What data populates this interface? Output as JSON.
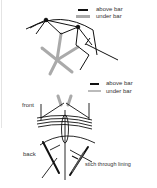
{
  "figure": {
    "legend_top": {
      "above_label": "above bar",
      "under_label": "under bar"
    },
    "legend_bottom": {
      "above_label": "above bar",
      "under_label": "under bar"
    },
    "labels": {
      "front": "front",
      "back": "back",
      "stitch": "stich through lining"
    },
    "colors": {
      "above": "#111111",
      "under": "#aaaaaa",
      "text": "#333333"
    }
  }
}
